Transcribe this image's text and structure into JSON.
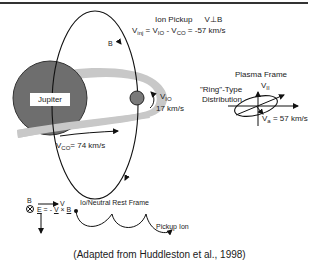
{
  "figure": {
    "caption": "(Adapted from Huddleston et al., 1998)",
    "top_rule_color": "#333333"
  },
  "planet": {
    "label": "Jupiter",
    "fill_color": "#6e6e6e"
  },
  "torus": {
    "fill_color": "#c8c8c8"
  },
  "io": {
    "fill_color": "#7a7a7a",
    "velocity_label": "V",
    "velocity_sub": "IO",
    "velocity_value": "17 km/s"
  },
  "field_line": {
    "label": "B"
  },
  "corotation": {
    "label_v": "V",
    "label_sub": "CO",
    "label_rest": "= 74 km/s"
  },
  "ion_pickup": {
    "title": "Ion Pickup",
    "condition": "V⊥B",
    "equation_v": "V",
    "equation_sub": "inj",
    "equation_rest": "= V",
    "equation_io_sub": "IO",
    "equation_minus": " - V",
    "equation_co_sub": "CO",
    "equation_result": " = -57 km/s"
  },
  "plasma_frame": {
    "title": "Plasma Frame",
    "axis_v": "V",
    "axis_sub": "II",
    "ring_line1": "\"Ring\"-Type",
    "ring_line2": "Distribution",
    "va_v": "V",
    "va_sub": "a",
    "va_value": " = 57 km/s"
  },
  "rest_frame": {
    "title": "Io/Neutral Rest Frame",
    "b_label": "B",
    "v_label": "V",
    "e_label": "E",
    "eq_middle": " = - ",
    "eq_v": "V",
    "eq_cross": " × ",
    "eq_b": "B",
    "pickup_label": "Pickup Ion"
  }
}
